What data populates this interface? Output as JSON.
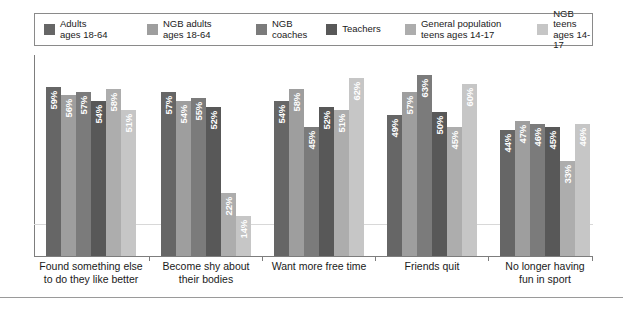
{
  "legend": {
    "items": [
      {
        "label": "Adults\nages 18-64",
        "color": "#666666"
      },
      {
        "label": "NGB adults\nages 18-64",
        "color": "#9e9e9e"
      },
      {
        "label": "NGB\ncoaches",
        "color": "#7b7b7b"
      },
      {
        "label": "Teachers",
        "color": "#585858"
      },
      {
        "label": "General population\nteens ages 14-17",
        "color": "#adadad"
      },
      {
        "label": "NGB teens\nages 14-17",
        "color": "#c6c6c6"
      }
    ]
  },
  "chart_data": {
    "type": "bar",
    "title": "",
    "xlabel": "",
    "ylabel": "",
    "ylim": [
      0,
      70
    ],
    "grid": true,
    "legend_position": "top",
    "value_suffix": "%",
    "categories": [
      "Found something else\nto do they like better",
      "Become shy about\ntheir bodies",
      "Want more free time",
      "Friends quit",
      "No longer having\nfun in sport"
    ],
    "series": [
      {
        "name": "Adults ages 18-64",
        "color": "#666666",
        "values": [
          59,
          57,
          54,
          49,
          44
        ]
      },
      {
        "name": "NGB adults ages 18-64",
        "color": "#9e9e9e",
        "values": [
          56,
          54,
          58,
          57,
          47
        ]
      },
      {
        "name": "NGB coaches",
        "color": "#7b7b7b",
        "values": [
          57,
          55,
          45,
          63,
          46
        ]
      },
      {
        "name": "Teachers",
        "color": "#585858",
        "values": [
          54,
          52,
          52,
          50,
          45
        ]
      },
      {
        "name": "General population teens ages 14-17",
        "color": "#adadad",
        "values": [
          58,
          22,
          51,
          45,
          33
        ]
      },
      {
        "name": "NGB teens ages 14-17",
        "color": "#c6c6c6",
        "values": [
          51,
          14,
          62,
          60,
          46
        ]
      }
    ]
  }
}
